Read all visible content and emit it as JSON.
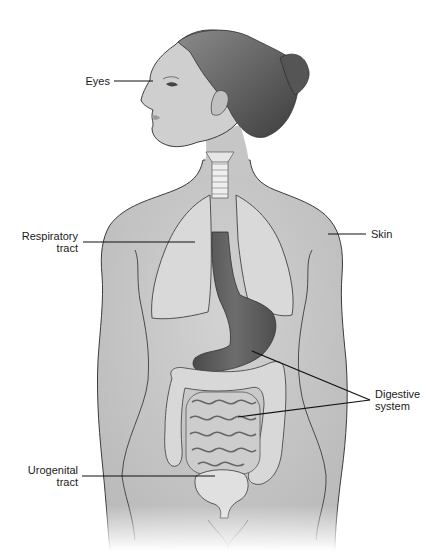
{
  "figure": {
    "colors": {
      "skin": "#c9c9c9",
      "skin_shade": "#b4b4b4",
      "outline": "#3c3c3c",
      "hair": "#6e6e6e",
      "hair_dark": "#3f3f3f",
      "lungs": "#dcdcdc",
      "trachea": "#eeeeee",
      "esophagus_stomach": "#5e5e5e",
      "intestines": "#d6d6d6",
      "bladder": "#e2e2e2",
      "leader_line": "#111111",
      "text": "#1a1a1a"
    }
  },
  "labels": {
    "eyes": "Eyes",
    "respiratory": "Respiratory\ntract",
    "skin": "Skin",
    "digestive": "Digestive\nsystem",
    "urogenital": "Urogenital\ntract"
  }
}
